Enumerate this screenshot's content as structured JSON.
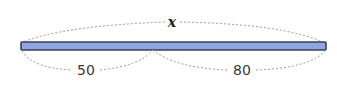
{
  "diagram": {
    "type": "segment-length",
    "total_label": "x",
    "segments": [
      {
        "label": "50"
      },
      {
        "label": "80"
      }
    ],
    "colors": {
      "bar_fill": "#8fa5e0",
      "bar_stroke": "#3a3f5c",
      "dash": "#9a9a9a"
    }
  }
}
